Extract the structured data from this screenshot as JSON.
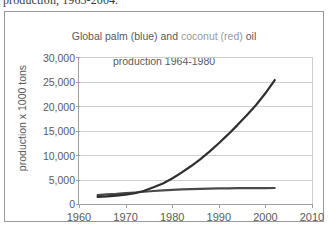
{
  "caption": {
    "cut_off_line": "production, 1963-2004."
  },
  "chart_data": {
    "type": "line",
    "title": "Global palm (blue) and coconut (red) oil\nproduction 1964-1980",
    "title_parts": {
      "before": "Global palm (blue) and ",
      "highlight": "coconut (red)",
      "after": " oil",
      "second_line": "production 1964-1980"
    },
    "xlabel": "",
    "ylabel": "production x 1000 tons",
    "xlim": [
      1960,
      2010
    ],
    "ylim": [
      0,
      30000
    ],
    "grid": true,
    "legend": "inline-in-title",
    "x_ticks": [
      "1960",
      "1970",
      "1980",
      "1990",
      "2000",
      "2010"
    ],
    "x_tick_values": [
      1960,
      1970,
      1980,
      1990,
      2000,
      2010
    ],
    "y_ticks": [
      "0",
      "5,000",
      "10,000",
      "15,000",
      "20,000",
      "25,000",
      "30,000"
    ],
    "y_tick_values": [
      0,
      5000,
      10000,
      15000,
      20000,
      25000,
      30000
    ],
    "series": [
      {
        "name": "palm",
        "color": "#2f2f2f",
        "x": [
          1964,
          1966,
          1968,
          1970,
          1972,
          1974,
          1976,
          1978,
          1980,
          1982,
          1984,
          1986,
          1988,
          1990,
          1992,
          1994,
          1996,
          1998,
          2000,
          2002
        ],
        "values": [
          1450,
          1550,
          1700,
          1900,
          2200,
          2700,
          3400,
          4200,
          5200,
          6400,
          7700,
          9100,
          10700,
          12400,
          14200,
          16100,
          18100,
          20200,
          22600,
          25300
        ]
      },
      {
        "name": "coconut",
        "color": "#4a4a4a",
        "x": [
          1964,
          1966,
          1968,
          1970,
          1972,
          1974,
          1976,
          1978,
          1980,
          1982,
          1984,
          1986,
          1988,
          1990,
          1992,
          1994,
          1996,
          1998,
          2000,
          2002
        ],
        "values": [
          1800,
          1950,
          2050,
          2200,
          2350,
          2500,
          2650,
          2800,
          2900,
          2980,
          3050,
          3100,
          3150,
          3180,
          3200,
          3220,
          3240,
          3250,
          3260,
          3270
        ]
      }
    ]
  },
  "colors": {
    "frame": "#9a9a9a",
    "axis": "#a0a0a0",
    "grid": "#cfcfcf",
    "text": "#5a5a5a",
    "palm_line": "#2f2f2f",
    "coconut_line": "#4a4a4a"
  }
}
